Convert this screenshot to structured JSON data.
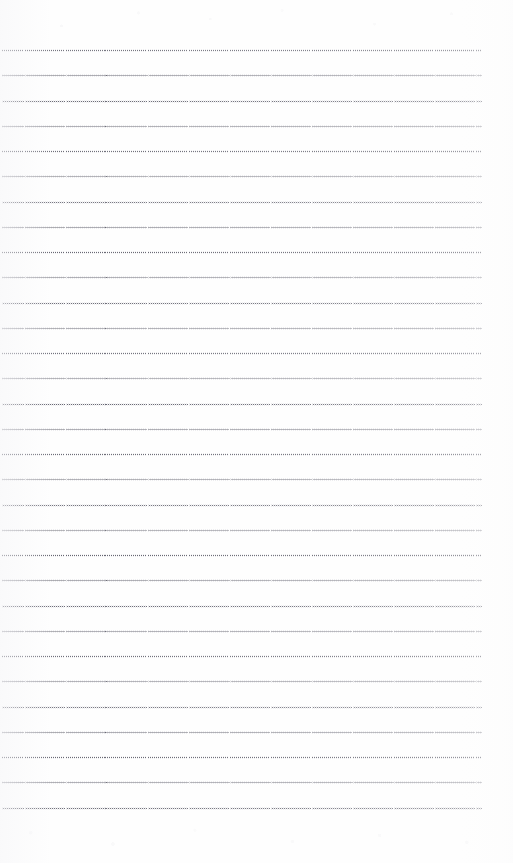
{
  "document": {
    "kind": "scanned-blank-ruled-paper",
    "page_width": 513,
    "page_height": 863,
    "background_color": "#fefefe",
    "has_text": false,
    "has_handwriting": false,
    "visible_text": ""
  },
  "ruling": {
    "style": "dotted",
    "rule_color": "#58586  4",
    "rule_color_hex": "#585864",
    "line_count": 31,
    "first_line_y": 50,
    "line_spacing": 25.25,
    "line_left_x": 2,
    "line_right_x": 482,
    "line_thickness": 1,
    "dot_period": 2.05,
    "dot_width": 1,
    "lines_y": [
      50,
      75.25,
      100.5,
      125.75,
      151,
      176.25,
      201.5,
      226.75,
      252,
      277.25,
      302.5,
      327.75,
      353,
      378.25,
      403.5,
      428.75,
      454,
      479.25,
      504.5,
      529.75,
      555,
      580.25,
      605.5,
      630.75,
      656,
      681.25,
      706.5,
      731.75,
      757,
      782.25,
      807.5
    ]
  },
  "margins": {
    "top_margin_height": 50,
    "bottom_margin_height": 55,
    "left_margin_width": 2,
    "right_margin_width": 31
  }
}
